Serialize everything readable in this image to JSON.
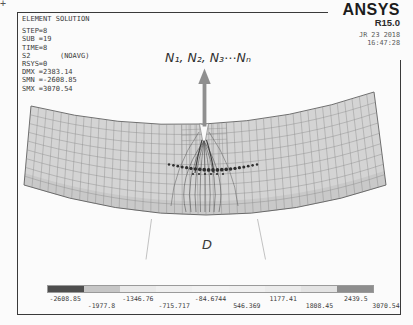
{
  "solution_info": {
    "lines": [
      "ELEMENT SOLUTION",
      "STEP=8",
      "SUB =19",
      "TIME=8",
      "S2       (NOAVG)",
      "RSYS=0",
      "DMX =2383.14",
      "SMN =-2608.85",
      "SMX =3070.54"
    ]
  },
  "brand": {
    "name": "ANSYS",
    "release": "R15.0",
    "date": "JR 23 2018",
    "time": "16:47:28"
  },
  "annotations": {
    "load_label": "N₁, N₂, N₃⋯Nₙ",
    "diameter_label": "D"
  },
  "legend": {
    "values": [
      "-2608.85",
      "-1977.8",
      "-1346.76",
      "-715.717",
      "-84.6744",
      "546.369",
      "1177.41",
      "1808.45",
      "2439.5",
      "3070.54"
    ],
    "segment_colors": [
      "#4e4e4e",
      "#c6c6c6",
      "#e9e9e9",
      "#efefef",
      "#f2f2f2",
      "#f0f0f0",
      "#ebebeb",
      "#e3e3e3",
      "#8e8e8e"
    ]
  },
  "model": {
    "colors": {
      "mesh_fill": "#d4d4d4",
      "mesh_line": "#8c8c8c",
      "outline": "#6f6f6f",
      "contour": "#555555",
      "arrow": "#8f8f8f",
      "leader": "#b2b2b2",
      "dots": "#2f2f2f",
      "notch_fill": "#fafafa"
    },
    "crop_mark": "+"
  }
}
